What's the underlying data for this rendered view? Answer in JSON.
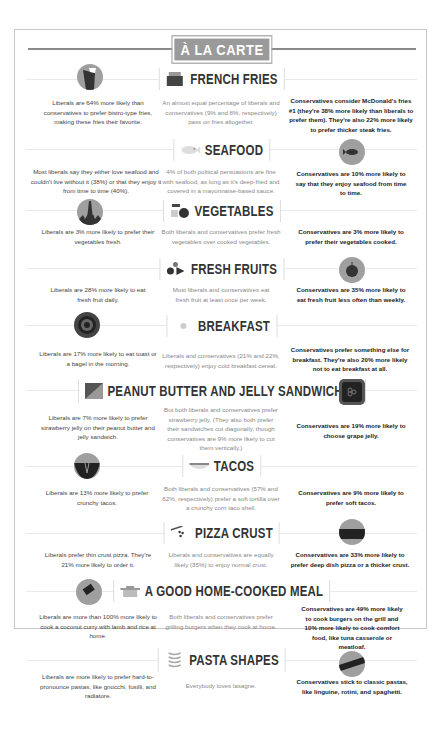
{
  "header": {
    "title": "À LA CARTE"
  },
  "sections": [
    {
      "label": "FRENCH FRIES",
      "icon": "fries-box-icon",
      "liberal": "Liberals are 64% more likely than conservatives to prefer bistro-type fries, making these fries their favorite.",
      "both": "An almost equal percentage of liberals and conservatives (9% and 8%, respectively) pass on fries altogether.",
      "conservative": "Conservatives consider McDonald's fries #1 (they're 38% more likely than liberals to prefer them). They're also 22% more likely to prefer thicker steak fries.",
      "side_icon": "bistro-fries-cup-icon",
      "side": "liberal"
    },
    {
      "label": "SEAFOOD",
      "icon": "fish-icon",
      "liberal": "Most liberals say they either love seafood and couldn't live without it (38%) or that they enjoy it from time to time (40%).",
      "both": "4% of both political persuasions are fine with seafood, as long as it's deep-fried and covered in a mayonnaise-based sauce.",
      "conservative": "Conservatives are 10% more likely to say that they enjoy seafood from time to time.",
      "side_icon": "fried-fish-icon",
      "side": "conservative"
    },
    {
      "label": "VEGETABLES",
      "icon": "vegetables-icon",
      "liberal": "Liberals are 3% more likely to prefer their vegetables fresh.",
      "both": "Both liberals and conservatives prefer fresh vegetables over cooked vegetables.",
      "conservative": "Conservatives are 3% more likely to prefer their vegetables cooked.",
      "side_icon": "carrot-icon",
      "side": "liberal"
    },
    {
      "label": "FRESH FRUITS",
      "icon": "fruits-icon",
      "liberal": "Liberals are 28% more likely to eat fresh fruit daily.",
      "both": "Most liberals and conservatives eat fresh fruit at least once per week.",
      "conservative": "Conservatives are 35% more likely to eat fresh fruit less often than weekly.",
      "side_icon": "apple-icon",
      "side": "conservative"
    },
    {
      "label": "BREAKFAST",
      "icon": "egg-icon",
      "liberal": "Liberals are 17% more likely to eat toast or a bagel in the morning.",
      "both": "Liberals and conservatives (21% and 22%, respectively) enjoy cold breakfast cereal.",
      "conservative": "Conservatives prefer something else for breakfast. They're also 20% more likely not to eat breakfast at all.",
      "side_icon": "bagel-icon",
      "side": "liberal"
    },
    {
      "label": "PEANUT BUTTER AND JELLY SANDWICHES",
      "icon": "sandwich-icon",
      "liberal": "Liberals are 7% more likely to prefer strawberry jelly on their peanut butter and jelly sandwich.",
      "both": "But both liberals and conservatives prefer strawberry jelly. (They also both prefer their sandwiches cut diagonally, though conservatives are 9% more likely to cut them vertically.)",
      "conservative": "Conservatives are 19% more likely to choose grape jelly.",
      "side_icon": "grape-jelly-jar-icon",
      "side": "conservative"
    },
    {
      "label": "TACOS",
      "icon": "taco-icon",
      "liberal": "Liberals are 13% more likely to prefer crunchy tacos.",
      "both": "Both liberals and conservatives (57% and 62%, respectively) prefer a soft tortilla over a crunchy corn taco shell.",
      "conservative": "Conservatives are 9% more likely to prefer soft tacos.",
      "side_icon": "crunchy-taco-icon",
      "side": "liberal"
    },
    {
      "label": "PIZZA CRUST",
      "icon": "pizza-slice-icon",
      "liberal": "Liberals prefer thin crust pizza. They're 21% more likely to order it.",
      "both": "Liberals and conservatives are equally likely (35%) to enjoy normal crust.",
      "conservative": "Conservatives are 33% more likely to prefer deep dish pizza or a thicker crust.",
      "side_icon": "deep-dish-pizza-icon",
      "side": "conservative"
    },
    {
      "label": "A GOOD HOME-COOKED MEAL",
      "icon": "pot-icon",
      "liberal": "Liberals are more than 100% more likely to cook a coconut curry with lamb and rice at home.",
      "both": "Both liberals and conservatives prefer grilling burgers when they cook at home.",
      "conservative": "Conservatives are 49% more likely to cook burgers on the grill and 10% more likely to cook comfort food, like tuna casserole or meatloaf.",
      "side_icon": "curry-pan-icon",
      "side": "liberal"
    },
    {
      "label": "PASTA SHAPES",
      "icon": "pasta-icon",
      "liberal": "Liberals are more likely to prefer hard-to-pronounce pastas, like gnocchi, fusilli, and radiatore.",
      "both": "Everybody loves lasagne.",
      "conservative": "Conservatives stick to classic pastas, like linguine, rotini, and spaghetti.",
      "side_icon": "rotini-pasta-icon",
      "side": "conservative"
    }
  ],
  "colors": {
    "icon_circle": "#9f9f9f",
    "icon_dark": "#333333",
    "badge": "#9a9a9a",
    "border": "#c8c8c8"
  }
}
